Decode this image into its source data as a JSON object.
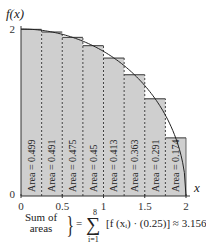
{
  "chart_data": {
    "type": "bar",
    "title": "",
    "xlabel": "x",
    "ylabel": "f(x)",
    "xlim": [
      0,
      2
    ],
    "ylim": [
      0,
      2
    ],
    "x_ticks": [
      "0",
      "0.5",
      "1",
      "1.5",
      "2"
    ],
    "y_ticks": [
      "0",
      "2"
    ],
    "bar_width": 0.25,
    "x_left": [
      0,
      0.25,
      0.5,
      0.75,
      1.0,
      1.25,
      1.5,
      1.75
    ],
    "heights": [
      1.996,
      1.964,
      1.9,
      1.8,
      1.652,
      1.452,
      1.164,
      0.696
    ],
    "bar_labels": [
      "Area = 0.499",
      "Area = 0.491",
      "Area = 0.475",
      "Area = 0.45",
      "Area = 0.413",
      "Area = 0.363",
      "Area = 0.291",
      "Area = 0.174"
    ],
    "areas": [
      0.499,
      0.491,
      0.475,
      0.45,
      0.413,
      0.363,
      0.291,
      0.174
    ],
    "curve": "f(x) = sqrt(4 - x^2)",
    "colors": {
      "bar": "#cfcfcf",
      "stroke": "#333333"
    }
  },
  "summary": {
    "label_line1": "Sum of",
    "label_line2": "areas",
    "equals": "=",
    "sigma": "∑",
    "upper": "8",
    "lower": "i=1",
    "expression": "[f (xᵢ) · (0.25)] ≈ 3.156"
  }
}
